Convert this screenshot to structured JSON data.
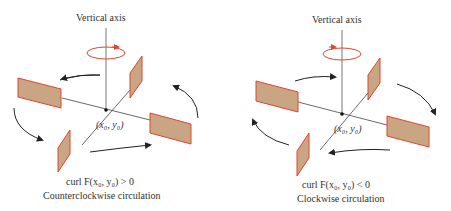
{
  "panels": [
    {
      "axis_label": "Vertical axis",
      "point_label": "(x₀, y₀)",
      "caption_line1": "curl F(x₀, y₀) > 0",
      "caption_line2": "Counterclockwise circulation",
      "rotation": "counterclockwise"
    },
    {
      "axis_label": "Vertical axis",
      "point_label": "(x₀, y₀)",
      "caption_line1": "curl F(x₀, y₀) < 0",
      "caption_line2": "Clockwise circulation",
      "rotation": "clockwise"
    }
  ],
  "colors": {
    "paddle_fill": "#c9a583",
    "paddle_edge": "#e0442f",
    "rotation_arrow": "#e0442f",
    "axis": "#444444",
    "flow_arrow": "#222222"
  }
}
